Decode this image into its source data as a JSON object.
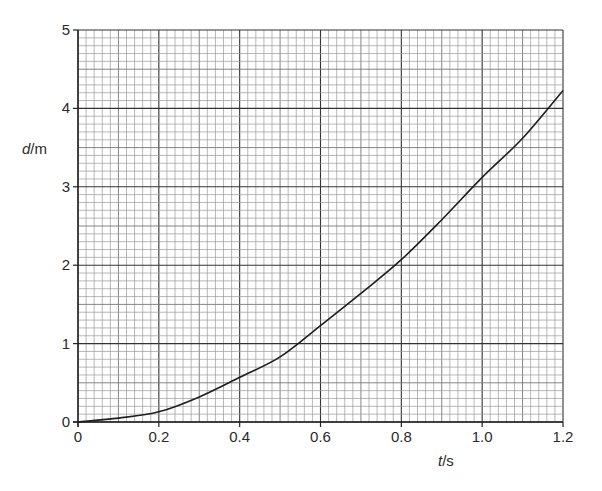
{
  "chart_data": {
    "type": "line",
    "title": "",
    "xlabel": "t/s",
    "xlabel_var": "t",
    "xlabel_unit": "/s",
    "ylabel": "d/m",
    "ylabel_var": "d",
    "ylabel_unit": "/m",
    "xlim": [
      0,
      1.2
    ],
    "ylim": [
      0,
      5
    ],
    "x_ticks": [
      "0",
      "0.2",
      "0.4",
      "0.6",
      "0.8",
      "1.0",
      "1.2"
    ],
    "y_ticks": [
      "0",
      "1",
      "2",
      "3",
      "4",
      "5"
    ],
    "grid": {
      "on": true,
      "x_major": 0.2,
      "x_minor": 0.02,
      "y_major": 1,
      "y_minor": 0.1
    },
    "legend": null,
    "series": [
      {
        "name": "distance vs time",
        "x": [
          0,
          0.1,
          0.2,
          0.3,
          0.4,
          0.5,
          0.6,
          0.7,
          0.8,
          0.9,
          1.0,
          1.1,
          1.2
        ],
        "values": [
          0,
          0.05,
          0.13,
          0.32,
          0.57,
          0.83,
          1.23,
          1.64,
          2.07,
          2.58,
          3.12,
          3.62,
          4.23
        ]
      }
    ]
  }
}
